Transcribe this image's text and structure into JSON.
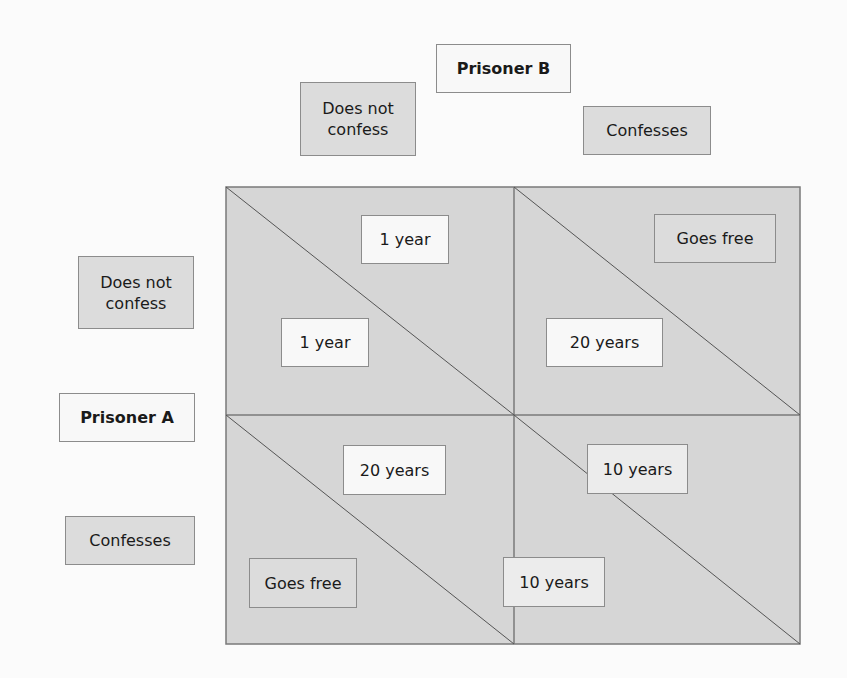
{
  "player_b": {
    "label": "Prisoner B",
    "strategies": [
      "Does not confess",
      "Confesses"
    ]
  },
  "player_a": {
    "label": "Prisoner A",
    "strategies": [
      "Does not confess",
      "Confesses"
    ]
  },
  "header_b": {
    "label": "Prisoner B",
    "col0_line1": "Does not",
    "col0_line2": "confess",
    "col1": "Confesses"
  },
  "header_a": {
    "label": "Prisoner A",
    "row0_line1": "Does not",
    "row0_line2": "confess",
    "row1": "Confesses"
  },
  "cells": [
    {
      "row": 0,
      "col": 0,
      "payoff_b": "1 year",
      "payoff_a": "1 year"
    },
    {
      "row": 0,
      "col": 1,
      "payoff_b": "Goes free",
      "payoff_a": "20 years"
    },
    {
      "row": 1,
      "col": 0,
      "payoff_b": "20 years",
      "payoff_a": "Goes free"
    },
    {
      "row": 1,
      "col": 1,
      "payoff_b": "10 years",
      "payoff_a": "10 years"
    }
  ],
  "colors": {
    "matrix_fill": "#d6d6d6",
    "box_border": "#8c8c8c",
    "grid_line": "#6e6e6e",
    "background": "#fbfbfb"
  }
}
